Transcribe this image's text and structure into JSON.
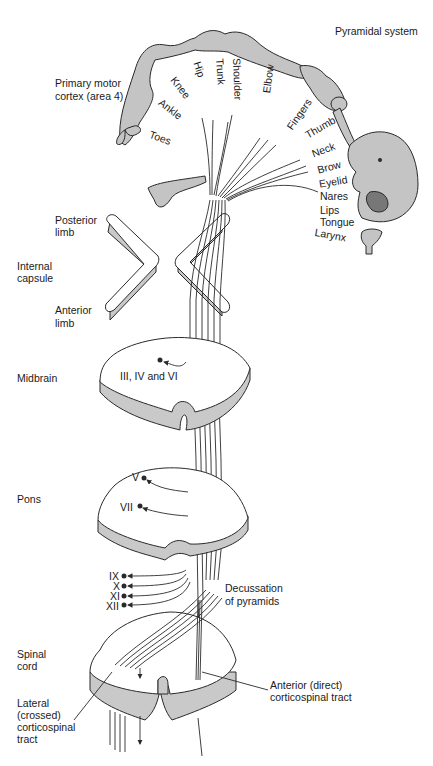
{
  "title": "Pyramidal system",
  "colors": {
    "fill_gray": "#c4c4c4",
    "side_gray": "#c9c9c9",
    "stroke": "#2a2a2a",
    "background": "#ffffff"
  },
  "cortex": {
    "label_line1": "Primary motor",
    "label_line2": "cortex (area 4)",
    "homunculus_parts": [
      "Toes",
      "Ankle",
      "Knee",
      "Hip",
      "Trunk",
      "Shoulder",
      "Elbow",
      "Fingers",
      "Thumb",
      "Neck",
      "Brow",
      "Eyelid",
      "Nares",
      "Lips",
      "Tongue",
      "Larynx"
    ]
  },
  "internal_capsule": {
    "posterior_limb_line1": "Posterior",
    "posterior_limb_line2": "limb",
    "label_line1": "Internal",
    "label_line2": "capsule",
    "anterior_limb_line1": "Anterior",
    "anterior_limb_line2": "limb"
  },
  "midbrain": {
    "label": "Midbrain",
    "nuclei": "III, IV and VI"
  },
  "pons": {
    "label": "Pons",
    "nuclei": [
      "V",
      "VII"
    ]
  },
  "medulla": {
    "nuclei": [
      "IX",
      "X",
      "XI",
      "XII"
    ],
    "decussation_line1": "Decussation",
    "decussation_line2": "of pyramids"
  },
  "spinal_cord": {
    "label_line1": "Spinal",
    "label_line2": "cord",
    "lateral_line1": "Lateral",
    "lateral_line2": "(crossed)",
    "lateral_line3": "corticospinal",
    "lateral_line4": "tract",
    "anterior_line1": "Anterior (direct)",
    "anterior_line2": "corticospinal tract"
  }
}
